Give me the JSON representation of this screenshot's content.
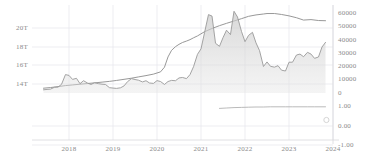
{
  "chart_data": {
    "type": "area",
    "title": "",
    "subtitle": "",
    "xlabel": "",
    "ylabel": "",
    "grid": true,
    "legend_position": "none",
    "x_ticks": [
      "2018",
      "2019",
      "2020",
      "2021",
      "2022",
      "2023",
      "2024"
    ],
    "x_tick_positions": [
      69,
      113,
      157,
      201,
      245,
      289,
      333
    ],
    "x_range": [
      "2017-05",
      "2023-11"
    ],
    "axes": [
      {
        "id": "left",
        "side": "left",
        "tick_labels": [
          "20T",
          "18T",
          "16T",
          "14T"
        ],
        "tick_values": [
          20000000000000,
          18000000000000,
          16000000000000,
          14000000000000
        ],
        "tick_y": [
          28,
          47,
          65,
          84
        ],
        "range": [
          13000000000000,
          21500000000000
        ]
      },
      {
        "id": "right-price",
        "side": "right",
        "tick_labels": [
          "60000",
          "50000",
          "40000",
          "30000",
          "20000",
          "10000",
          "0"
        ],
        "tick_values": [
          60000,
          50000,
          40000,
          30000,
          20000,
          10000,
          0
        ],
        "tick_y": [
          13,
          26,
          40,
          53,
          66,
          79,
          93
        ],
        "range": [
          0,
          65000
        ]
      },
      {
        "id": "right-ratio",
        "side": "right",
        "tick_labels": [
          "1.00",
          "0.00",
          "-1.00"
        ],
        "tick_values": [
          1.0,
          0.0,
          -1.0
        ],
        "tick_y": [
          106,
          126,
          145
        ],
        "range": [
          -1.3,
          1.3
        ]
      }
    ],
    "series": [
      {
        "name": "m2-money-supply",
        "axis": "left",
        "render": "line",
        "color": "#8c8c8c",
        "width": 0.9,
        "points": [
          [
            2017.42,
            13.55
          ],
          [
            2017.58,
            13.62
          ],
          [
            2017.75,
            13.72
          ],
          [
            2017.92,
            13.83
          ],
          [
            2018.08,
            13.9
          ],
          [
            2018.25,
            13.98
          ],
          [
            2018.42,
            14.05
          ],
          [
            2018.58,
            14.12
          ],
          [
            2018.75,
            14.2
          ],
          [
            2018.92,
            14.28
          ],
          [
            2019.08,
            14.38
          ],
          [
            2019.25,
            14.5
          ],
          [
            2019.42,
            14.62
          ],
          [
            2019.58,
            14.76
          ],
          [
            2019.75,
            14.9
          ],
          [
            2019.92,
            15.06
          ],
          [
            2020.08,
            15.3
          ],
          [
            2020.17,
            15.8
          ],
          [
            2020.25,
            16.9
          ],
          [
            2020.33,
            17.6
          ],
          [
            2020.42,
            18.0
          ],
          [
            2020.5,
            18.25
          ],
          [
            2020.58,
            18.45
          ],
          [
            2020.67,
            18.6
          ],
          [
            2020.75,
            18.75
          ],
          [
            2020.83,
            18.95
          ],
          [
            2020.92,
            19.15
          ],
          [
            2021.08,
            19.6
          ],
          [
            2021.25,
            19.95
          ],
          [
            2021.42,
            20.25
          ],
          [
            2021.58,
            20.5
          ],
          [
            2021.75,
            20.75
          ],
          [
            2021.92,
            21.0
          ],
          [
            2022.08,
            21.25
          ],
          [
            2022.25,
            21.4
          ],
          [
            2022.42,
            21.5
          ],
          [
            2022.5,
            21.55
          ],
          [
            2022.67,
            21.55
          ],
          [
            2022.83,
            21.45
          ],
          [
            2023.0,
            21.3
          ],
          [
            2023.17,
            21.1
          ],
          [
            2023.33,
            20.85
          ],
          [
            2023.5,
            20.9
          ],
          [
            2023.67,
            20.8
          ],
          [
            2023.83,
            20.78
          ]
        ],
        "unit": "trillions USD"
      },
      {
        "name": "bitcoin-price",
        "axis": "right-price",
        "render": "area",
        "color": "#9a9a9a",
        "fill": "#d9d9d9",
        "fill_opacity": 0.55,
        "width": 0.9,
        "points": [
          [
            2017.42,
            2400
          ],
          [
            2017.5,
            2700
          ],
          [
            2017.58,
            2900
          ],
          [
            2017.67,
            4300
          ],
          [
            2017.75,
            4400
          ],
          [
            2017.83,
            6500
          ],
          [
            2017.92,
            13800
          ],
          [
            2018.0,
            13200
          ],
          [
            2018.08,
            10200
          ],
          [
            2018.17,
            11000
          ],
          [
            2018.25,
            7000
          ],
          [
            2018.33,
            9200
          ],
          [
            2018.42,
            7500
          ],
          [
            2018.5,
            6400
          ],
          [
            2018.58,
            7700
          ],
          [
            2018.67,
            7000
          ],
          [
            2018.75,
            6600
          ],
          [
            2018.83,
            6400
          ],
          [
            2018.92,
            4000
          ],
          [
            2019.0,
            3700
          ],
          [
            2019.08,
            3450
          ],
          [
            2019.17,
            3900
          ],
          [
            2019.25,
            5300
          ],
          [
            2019.33,
            8500
          ],
          [
            2019.42,
            10800
          ],
          [
            2019.5,
            10100
          ],
          [
            2019.58,
            9600
          ],
          [
            2019.67,
            8300
          ],
          [
            2019.75,
            9200
          ],
          [
            2019.83,
            7500
          ],
          [
            2019.92,
            7200
          ],
          [
            2020.0,
            9300
          ],
          [
            2020.08,
            8600
          ],
          [
            2020.17,
            6400
          ],
          [
            2020.25,
            8600
          ],
          [
            2020.33,
            9450
          ],
          [
            2020.42,
            9200
          ],
          [
            2020.5,
            11300
          ],
          [
            2020.58,
            11650
          ],
          [
            2020.67,
            10800
          ],
          [
            2020.75,
            13800
          ],
          [
            2020.83,
            19700
          ],
          [
            2020.92,
            29000
          ],
          [
            2021.0,
            33100
          ],
          [
            2021.08,
            45200
          ],
          [
            2021.17,
            58800
          ],
          [
            2021.25,
            57700
          ],
          [
            2021.33,
            37300
          ],
          [
            2021.42,
            35000
          ],
          [
            2021.5,
            41500
          ],
          [
            2021.58,
            47100
          ],
          [
            2021.67,
            43800
          ],
          [
            2021.75,
            61300
          ],
          [
            2021.83,
            57000
          ],
          [
            2021.92,
            46200
          ],
          [
            2022.0,
            38500
          ],
          [
            2022.08,
            43200
          ],
          [
            2022.17,
            45500
          ],
          [
            2022.25,
            37600
          ],
          [
            2022.33,
            31800
          ],
          [
            2022.42,
            19900
          ],
          [
            2022.5,
            23300
          ],
          [
            2022.58,
            20000
          ],
          [
            2022.67,
            19400
          ],
          [
            2022.75,
            20500
          ],
          [
            2022.83,
            17100
          ],
          [
            2022.92,
            16500
          ],
          [
            2023.0,
            23100
          ],
          [
            2023.08,
            23100
          ],
          [
            2023.17,
            28500
          ],
          [
            2023.25,
            29200
          ],
          [
            2023.33,
            27200
          ],
          [
            2023.42,
            30500
          ],
          [
            2023.5,
            29200
          ],
          [
            2023.58,
            26000
          ],
          [
            2023.67,
            27000
          ],
          [
            2023.75,
            34500
          ],
          [
            2023.83,
            38000
          ]
        ],
        "unit": "USD"
      },
      {
        "name": "correlation-ratio",
        "axis": "right-ratio",
        "render": "line",
        "color": "#a8a8a8",
        "width": 0.8,
        "points": [
          [
            2021.42,
            0.88
          ],
          [
            2021.58,
            0.9
          ],
          [
            2021.75,
            0.92
          ],
          [
            2021.92,
            0.93
          ],
          [
            2022.08,
            0.94
          ],
          [
            2022.25,
            0.95
          ],
          [
            2022.42,
            0.95
          ],
          [
            2022.58,
            0.96
          ],
          [
            2022.75,
            0.96
          ],
          [
            2022.92,
            0.96
          ],
          [
            2023.08,
            0.96
          ],
          [
            2023.25,
            0.96
          ],
          [
            2023.42,
            0.96
          ],
          [
            2023.58,
            0.96
          ],
          [
            2023.75,
            0.96
          ],
          [
            2023.83,
            0.96
          ]
        ],
        "unit": "ratio"
      }
    ],
    "markers": [
      {
        "name": "endpoint-marker",
        "x": 2023.85,
        "axis": "right-ratio",
        "y": 0.3,
        "shape": "circle",
        "color": "#d5d5d5",
        "radius": 2.6
      }
    ],
    "colors": {
      "grid": "#e9e9ee",
      "axis_line": "#d8d8dc",
      "tick_text": "#8a8a8a",
      "background": "#ffffff"
    }
  }
}
